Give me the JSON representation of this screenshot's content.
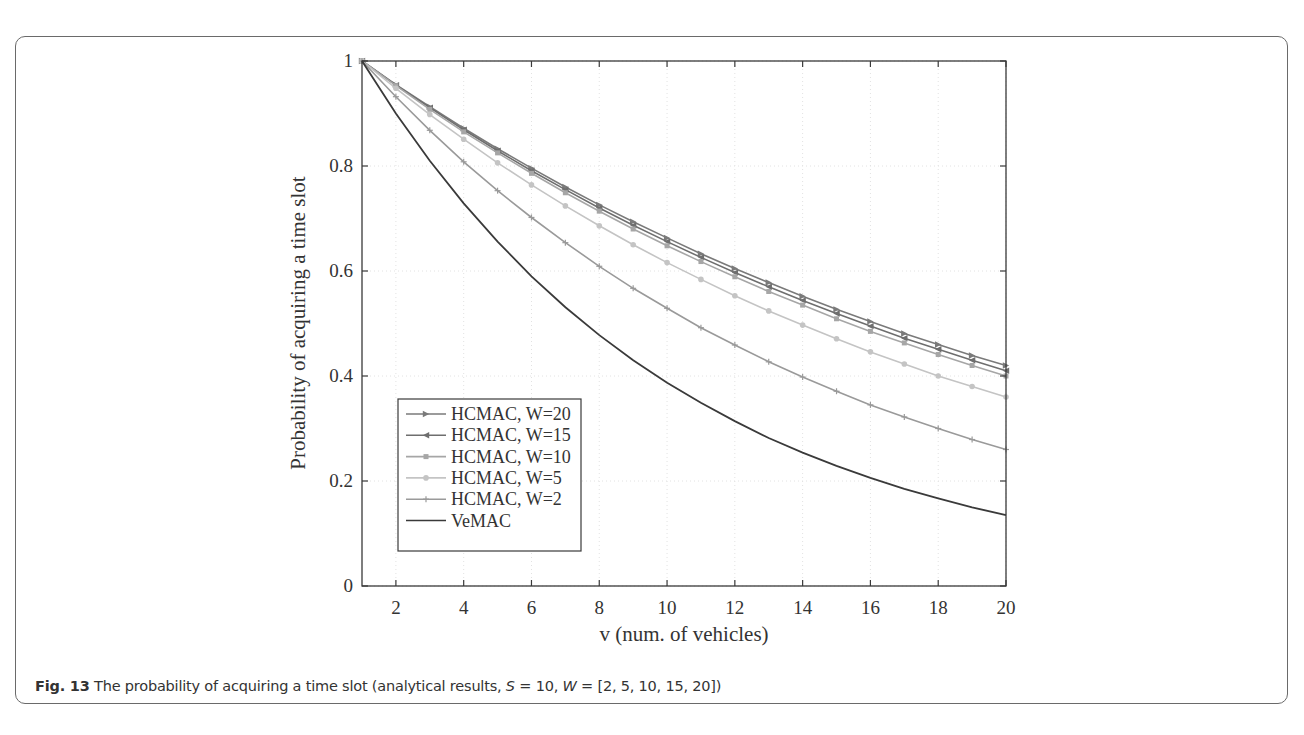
{
  "figure": {
    "caption_label": "Fig. 13",
    "caption_text_1": " The probability of acquiring a time slot (analytical results, ",
    "caption_S": "S",
    "caption_text_2": " = 10, ",
    "caption_W": "W",
    "caption_text_3": " = [2, 5, 10, 15, 20])"
  },
  "chart_data": {
    "type": "line",
    "title": "",
    "xlabel": "v (num. of vehicles)",
    "ylabel": "Probability of acquiring a time slot",
    "xlim": [
      1,
      20
    ],
    "ylim": [
      0,
      1
    ],
    "x_ticks": [
      2,
      4,
      6,
      8,
      10,
      12,
      14,
      16,
      18,
      20
    ],
    "y_ticks": [
      0,
      0.2,
      0.4,
      0.6,
      0.8,
      1
    ],
    "y_tick_labels": [
      "0",
      "0.2",
      "0.4",
      "0.6",
      "0.8",
      "1"
    ],
    "grid": true,
    "legend_position": "lower left",
    "x": [
      1,
      2,
      3,
      4,
      5,
      6,
      7,
      8,
      9,
      10,
      11,
      12,
      13,
      14,
      15,
      16,
      17,
      18,
      19,
      20
    ],
    "series": [
      {
        "name": "HCMAC, W=20",
        "color": "#7a7a7a",
        "marker": "triangle-right",
        "values": [
          1.0,
          0.955,
          0.913,
          0.872,
          0.833,
          0.796,
          0.76,
          0.726,
          0.694,
          0.663,
          0.633,
          0.605,
          0.578,
          0.552,
          0.527,
          0.504,
          0.481,
          0.46,
          0.439,
          0.42
        ]
      },
      {
        "name": "HCMAC, W=15",
        "color": "#6e6e6e",
        "marker": "triangle-left",
        "values": [
          1.0,
          0.954,
          0.911,
          0.869,
          0.829,
          0.791,
          0.755,
          0.72,
          0.687,
          0.656,
          0.626,
          0.597,
          0.57,
          0.544,
          0.519,
          0.495,
          0.472,
          0.451,
          0.43,
          0.41
        ]
      },
      {
        "name": "HCMAC, W=10",
        "color": "#a6a6a6",
        "marker": "square",
        "values": [
          1.0,
          0.953,
          0.908,
          0.865,
          0.825,
          0.786,
          0.749,
          0.714,
          0.68,
          0.648,
          0.618,
          0.589,
          0.561,
          0.535,
          0.509,
          0.485,
          0.463,
          0.441,
          0.42,
          0.4
        ]
      },
      {
        "name": "HCMAC, W=5",
        "color": "#c4c4c4",
        "marker": "circle",
        "values": [
          1.0,
          0.948,
          0.898,
          0.851,
          0.806,
          0.764,
          0.724,
          0.686,
          0.65,
          0.616,
          0.584,
          0.553,
          0.524,
          0.497,
          0.471,
          0.446,
          0.423,
          0.4,
          0.38,
          0.36
        ]
      },
      {
        "name": "HCMAC, W=2",
        "color": "#9a9a9a",
        "marker": "plus",
        "values": [
          1.0,
          0.932,
          0.868,
          0.808,
          0.753,
          0.702,
          0.654,
          0.609,
          0.567,
          0.529,
          0.492,
          0.459,
          0.427,
          0.398,
          0.371,
          0.345,
          0.322,
          0.3,
          0.279,
          0.26
        ]
      },
      {
        "name": "VeMAC",
        "color": "#3a3a3a",
        "marker": "none",
        "values": [
          1.0,
          0.9,
          0.81,
          0.729,
          0.656,
          0.59,
          0.531,
          0.478,
          0.43,
          0.387,
          0.349,
          0.314,
          0.282,
          0.254,
          0.229,
          0.206,
          0.185,
          0.167,
          0.15,
          0.135
        ]
      }
    ]
  }
}
